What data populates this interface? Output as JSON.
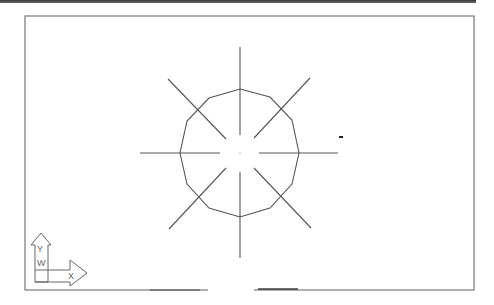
{
  "window": {
    "title": "CAD drawing viewport"
  },
  "viewport": {
    "border": {
      "x": 25,
      "y": 16,
      "width": 449,
      "height": 274
    },
    "border_color": "#777777",
    "line_color": "#555555"
  },
  "drawing": {
    "center": {
      "x": 240,
      "y": 153
    },
    "polygon": {
      "sides": 12,
      "points": "240,89 270,97 292,120 299,153 292,184 270,208 240,217 209,208 187,184 180,153 187,121 209,98"
    },
    "crosshair_lines": [
      {
        "name": "up",
        "x1": 240,
        "y1": 47,
        "x2": 240,
        "y2": 135
      },
      {
        "name": "down",
        "x1": 240,
        "y1": 172,
        "x2": 240,
        "y2": 258
      },
      {
        "name": "left",
        "x1": 140,
        "y1": 153,
        "x2": 220,
        "y2": 153
      },
      {
        "name": "right",
        "x1": 259,
        "y1": 153,
        "x2": 338,
        "y2": 153
      },
      {
        "name": "up-left",
        "x1": 168,
        "y1": 79,
        "x2": 226,
        "y2": 139
      },
      {
        "name": "up-right",
        "x1": 310,
        "y1": 78,
        "x2": 254,
        "y2": 138
      },
      {
        "name": "down-left",
        "x1": 169,
        "y1": 229,
        "x2": 226,
        "y2": 168
      },
      {
        "name": "down-right",
        "x1": 311,
        "y1": 228,
        "x2": 254,
        "y2": 168
      }
    ],
    "marker_dot": {
      "x": 341,
      "y": 137
    }
  },
  "ucs_icon": {
    "y_label": "Y",
    "x_label": "X",
    "w_label": "W"
  }
}
